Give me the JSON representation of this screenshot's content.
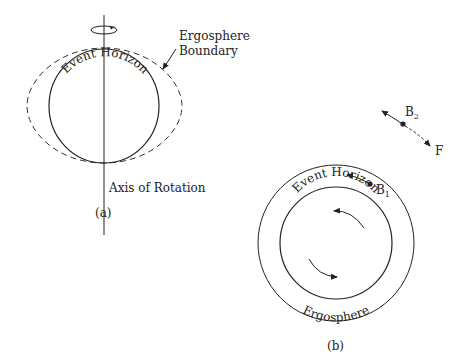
{
  "figure_a": {
    "ergosphere_label_line1": "Ergosphere",
    "ergosphere_label_line2": "Boundary",
    "event_horizon_label": "Event Horizon",
    "axis_label": "Axis of Rotation",
    "caption": "(a)"
  },
  "figure_b": {
    "event_horizon_label": "Event Horizon",
    "ergosphere_label": "Ergosphere",
    "b1_label": "B",
    "b1_sub": "1",
    "b2_label": "B",
    "b2_sub": "2",
    "f_label": "F",
    "caption": "(b)"
  },
  "colors": {
    "stroke": "#222222",
    "background": "#ffffff"
  }
}
